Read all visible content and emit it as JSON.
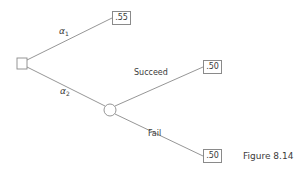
{
  "figure": {
    "caption": "Figure 8.14",
    "type": "decision-tree"
  },
  "nodes": {
    "decision": {
      "kind": "decision",
      "shape": "square"
    },
    "chance": {
      "kind": "chance",
      "shape": "circle"
    }
  },
  "branches": {
    "a1": {
      "symbol": "α",
      "subscript": "1",
      "from": "decision",
      "payoff": ".55"
    },
    "a2": {
      "symbol": "α",
      "subscript": "2",
      "from": "decision",
      "to": "chance"
    },
    "succeed": {
      "label": "Succeed",
      "from": "chance",
      "payoff": ".50"
    },
    "fail": {
      "label": "Fail",
      "from": "chance",
      "payoff": ".50"
    }
  },
  "colors": {
    "line": "#8a8a8a",
    "text": "#3a3a3a",
    "background": "#ffffff"
  }
}
